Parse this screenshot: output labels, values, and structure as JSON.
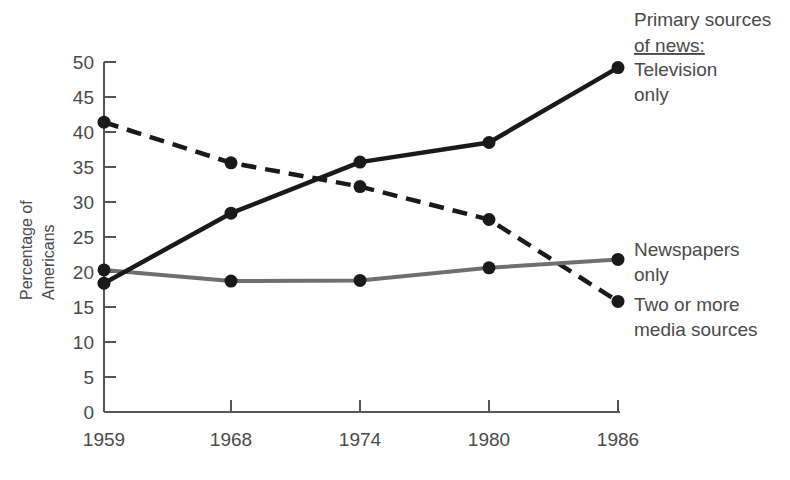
{
  "chart_data": {
    "type": "line",
    "title": "",
    "xlabel": "",
    "ylabel": "Percentage of Americans",
    "ylabel_line1": "Percentage of",
    "ylabel_line2": "Americans",
    "categories": [
      "1959",
      "1968",
      "1974",
      "1980",
      "1986"
    ],
    "x_tick_labels": [
      "1959",
      "1968",
      "1974",
      "1980",
      "1986"
    ],
    "y_tick_labels": [
      "0",
      "5",
      "10",
      "15",
      "20",
      "25",
      "30",
      "35",
      "40",
      "45",
      "50"
    ],
    "y_ticks": [
      0,
      5,
      10,
      15,
      20,
      25,
      30,
      35,
      40,
      45,
      50
    ],
    "ylim": [
      0,
      50
    ],
    "grid": false,
    "legend_position": "right",
    "legend_title_line1": "Primary sources",
    "legend_title_line2": "of news:",
    "series": [
      {
        "name": "Television only",
        "label_line1": "Television",
        "label_line2": "only",
        "style": "solid",
        "color": "#1a1a1a",
        "values": [
          18.4,
          28.4,
          35.7,
          38.5,
          49.2
        ]
      },
      {
        "name": "Newspapers only",
        "label_line1": "Newspapers",
        "label_line2": "only",
        "style": "solid-gray",
        "color": "#6f6f6f",
        "values": [
          20.3,
          18.7,
          18.8,
          20.6,
          21.8
        ]
      },
      {
        "name": "Two or more media sources",
        "label_line1": "Two or more",
        "label_line2": "media sources",
        "style": "dashed",
        "color": "#1a1a1a",
        "values": [
          41.4,
          35.6,
          32.2,
          27.5,
          15.8
        ]
      }
    ]
  },
  "axes": {
    "y_tick_0": "0",
    "y_tick_5": "5",
    "y_tick_10": "10",
    "y_tick_15": "15",
    "y_tick_20": "20",
    "y_tick_25": "25",
    "y_tick_30": "30",
    "y_tick_35": "35",
    "y_tick_40": "40",
    "y_tick_45": "45",
    "y_tick_50": "50",
    "x_tick_0": "1959",
    "x_tick_1": "1968",
    "x_tick_2": "1974",
    "x_tick_3": "1980",
    "x_tick_4": "1986"
  }
}
